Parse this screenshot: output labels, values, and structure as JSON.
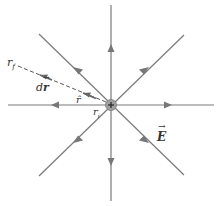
{
  "diagram": {
    "charge_symbol": "+",
    "labels": {
      "r_f": "r",
      "r_f_sub": "f",
      "r_i": "r",
      "r_i_sub": "i",
      "dr": "d",
      "dr_vec": "r",
      "r_hat": "r̂",
      "E": "E"
    },
    "colors": {
      "field_line": "#777777",
      "dashed_path": "#555555",
      "charge_fill": "#999999",
      "text": "#333333"
    }
  }
}
